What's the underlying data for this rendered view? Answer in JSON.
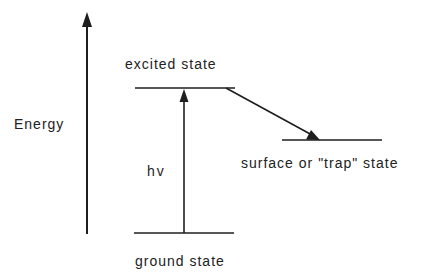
{
  "diagram": {
    "axis_label": "Energy",
    "levels": {
      "excited": "excited state",
      "trap": "surface or \"trap\" state",
      "ground": "ground state"
    },
    "transition_label": "hv",
    "colors": {
      "line": "#1e1e1e",
      "background": "#ffffff"
    }
  }
}
